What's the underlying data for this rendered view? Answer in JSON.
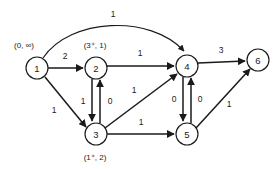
{
  "diagram": {
    "kind": "directed-flow-network",
    "nodes": [
      {
        "id": "1",
        "label": "1",
        "tag": "(0, ∞)",
        "cx": 37,
        "cy": 68,
        "r": 11,
        "tag_x": 24,
        "tag_y": 45
      },
      {
        "id": "2",
        "label": "2",
        "tag": "(3⁺, 1)",
        "cx": 96,
        "cy": 68,
        "r": 11,
        "tag_x": 95,
        "tag_y": 45
      },
      {
        "id": "3",
        "label": "3",
        "tag": "(1⁺, 2)",
        "cx": 96,
        "cy": 134,
        "r": 11,
        "tag_x": 95,
        "tag_y": 157
      },
      {
        "id": "4",
        "label": "4",
        "tag": "",
        "cx": 187,
        "cy": 66,
        "r": 11,
        "tag_x": 0,
        "tag_y": 0
      },
      {
        "id": "5",
        "label": "5",
        "tag": "",
        "cx": 187,
        "cy": 134,
        "r": 11,
        "tag_x": 0,
        "tag_y": 0
      },
      {
        "id": "6",
        "label": "6",
        "tag": "",
        "cx": 258,
        "cy": 60,
        "r": 11,
        "tag_x": 0,
        "tag_y": 0
      }
    ],
    "edges": [
      {
        "name": "edge-1-4-arc",
        "from": "1",
        "to": "4",
        "weight": "1",
        "path": "M 43 58 C 70 18, 150 14, 184 51",
        "label_x": 113,
        "label_y": 14,
        "curved": true
      },
      {
        "name": "edge-1-2",
        "from": "1",
        "to": "2",
        "weight": "2",
        "path": "M 48 68 L 83 68",
        "label_x": 65,
        "label_y": 56,
        "curved": false
      },
      {
        "name": "edge-1-3",
        "from": "1",
        "to": "3",
        "weight": "1",
        "path": "M 45 77 L 86 127",
        "label_x": 54,
        "label_y": 110,
        "curved": false
      },
      {
        "name": "edge-2-4",
        "from": "2",
        "to": "4",
        "weight": "1",
        "path": "M 107 66 L 174 66",
        "label_x": 140,
        "label_y": 53,
        "curved": false
      },
      {
        "name": "edge-2-3",
        "from": "2",
        "to": "3",
        "weight": "1",
        "path": "M 92 79 L 92 121",
        "label_x": 83,
        "label_y": 101,
        "curved": false
      },
      {
        "name": "edge-3-2",
        "from": "3",
        "to": "2",
        "weight": "0",
        "path": "M 100 123 L 100 80",
        "label_x": 110,
        "label_y": 101,
        "curved": false
      },
      {
        "name": "edge-3-4",
        "from": "3",
        "to": "4",
        "weight": "1",
        "path": "M 105 128 L 177 74",
        "label_x": 134,
        "label_y": 90,
        "curved": false
      },
      {
        "name": "edge-3-5",
        "from": "3",
        "to": "5",
        "weight": "1",
        "path": "M 107 134 L 174 134",
        "label_x": 141,
        "label_y": 122,
        "curved": false
      },
      {
        "name": "edge-4-6",
        "from": "4",
        "to": "6",
        "weight": "3",
        "path": "M 198 63 L 245 61",
        "label_x": 221,
        "label_y": 50,
        "curved": false
      },
      {
        "name": "edge-4-5",
        "from": "4",
        "to": "5",
        "weight": "0",
        "path": "M 183 77 L 183 121",
        "label_x": 174,
        "label_y": 99,
        "curved": false
      },
      {
        "name": "edge-5-4",
        "from": "5",
        "to": "4",
        "weight": "0",
        "path": "M 191 123 L 191 78",
        "label_x": 200,
        "label_y": 99,
        "curved": false
      },
      {
        "name": "edge-5-6",
        "from": "5",
        "to": "6",
        "weight": "1",
        "path": "M 196 128 L 250 69",
        "label_x": 229,
        "label_y": 104,
        "curved": false
      }
    ]
  }
}
